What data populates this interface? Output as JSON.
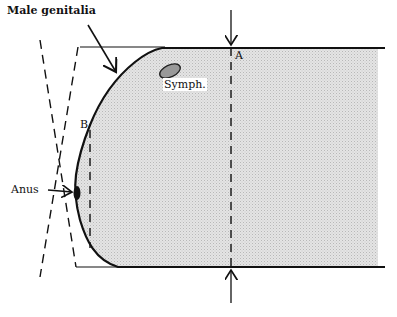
{
  "labels": {
    "male_genitalia": "Male genitalia",
    "symph": "Symph.",
    "point_a": "A",
    "point_b": "B",
    "anus": "Anus"
  },
  "colors": {
    "fill": "#d9d9d9",
    "stroke": "#111111",
    "symph_fill": "#999999"
  }
}
